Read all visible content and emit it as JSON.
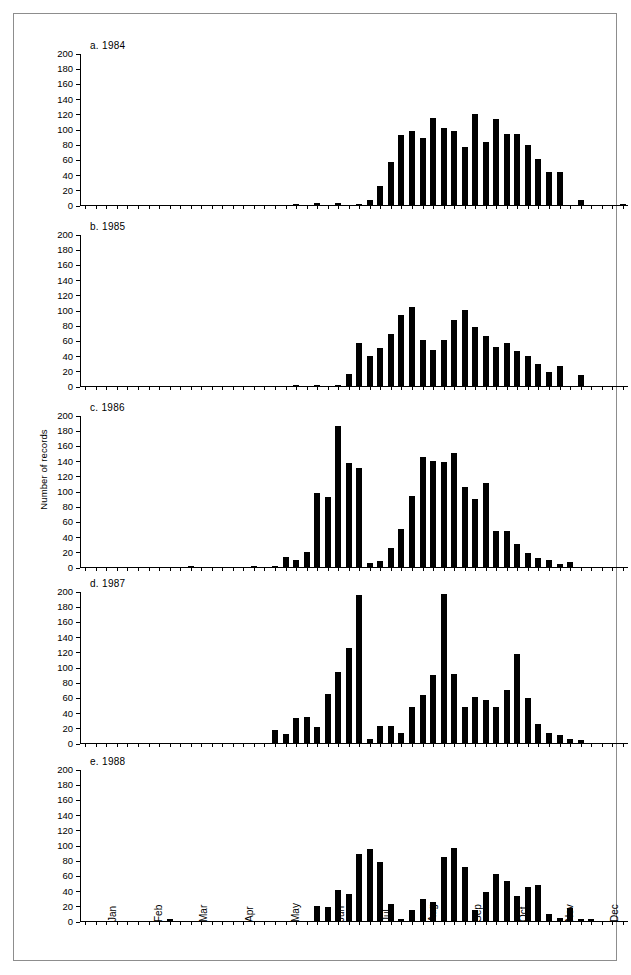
{
  "figure": {
    "ylabel": "Number of records",
    "y_ticks": [
      0,
      20,
      40,
      60,
      80,
      100,
      120,
      140,
      160,
      180,
      200
    ],
    "months": [
      "Jan",
      "Feb",
      "Mar",
      "Apr",
      "May",
      "Jun",
      "Jul",
      "Aug",
      "Sep",
      "Oct",
      "Nov",
      "Dec"
    ]
  },
  "chart_data": [
    {
      "type": "bar",
      "title": "a.  1984",
      "panel": "a",
      "year": 1984,
      "xlabel": "",
      "ylabel": "Number of records",
      "ylim": [
        0,
        200
      ],
      "xlim": [
        1,
        52
      ],
      "grid": false,
      "legend": "none",
      "categories": [
        1,
        2,
        3,
        4,
        5,
        6,
        7,
        8,
        9,
        10,
        11,
        12,
        13,
        14,
        15,
        16,
        17,
        18,
        19,
        20,
        21,
        22,
        23,
        24,
        25,
        26,
        27,
        28,
        29,
        30,
        31,
        32,
        33,
        34,
        35,
        36,
        37,
        38,
        39,
        40,
        41,
        42,
        43,
        44,
        45,
        46,
        47,
        48,
        49,
        50,
        51,
        52
      ],
      "values": [
        0,
        0,
        0,
        0,
        0,
        0,
        0,
        0,
        0,
        0,
        0,
        0,
        0,
        0,
        0,
        0,
        0,
        0,
        0,
        0,
        1,
        0,
        2,
        0,
        2,
        0,
        1,
        7,
        25,
        56,
        92,
        98,
        88,
        115,
        101,
        97,
        76,
        120,
        83,
        113,
        94,
        94,
        79,
        60,
        43,
        43,
        0,
        7,
        0,
        0,
        0,
        1
      ]
    },
    {
      "type": "bar",
      "title": "b.  1985",
      "panel": "b",
      "year": 1985,
      "xlabel": "",
      "ylabel": "Number of records",
      "ylim": [
        0,
        200
      ],
      "xlim": [
        1,
        52
      ],
      "grid": false,
      "legend": "none",
      "categories": [
        1,
        2,
        3,
        4,
        5,
        6,
        7,
        8,
        9,
        10,
        11,
        12,
        13,
        14,
        15,
        16,
        17,
        18,
        19,
        20,
        21,
        22,
        23,
        24,
        25,
        26,
        27,
        28,
        29,
        30,
        31,
        32,
        33,
        34,
        35,
        36,
        37,
        38,
        39,
        40,
        41,
        42,
        43,
        44,
        45,
        46,
        47,
        48,
        49,
        50,
        51,
        52
      ],
      "values": [
        0,
        0,
        0,
        0,
        0,
        0,
        0,
        0,
        0,
        0,
        0,
        0,
        0,
        0,
        0,
        0,
        0,
        0,
        0,
        0,
        1,
        0,
        1,
        0,
        1,
        16,
        57,
        40,
        50,
        68,
        93,
        104,
        61,
        48,
        61,
        87,
        100,
        78,
        66,
        51,
        56,
        46,
        39,
        29,
        18,
        26,
        0,
        14,
        0,
        0,
        0,
        0
      ]
    },
    {
      "type": "bar",
      "title": "c.  1986",
      "panel": "c",
      "year": 1986,
      "xlabel": "",
      "ylabel": "Number of records",
      "ylim": [
        0,
        200
      ],
      "xlim": [
        1,
        52
      ],
      "grid": false,
      "legend": "none",
      "categories": [
        1,
        2,
        3,
        4,
        5,
        6,
        7,
        8,
        9,
        10,
        11,
        12,
        13,
        14,
        15,
        16,
        17,
        18,
        19,
        20,
        21,
        22,
        23,
        24,
        25,
        26,
        27,
        28,
        29,
        30,
        31,
        32,
        33,
        34,
        35,
        36,
        37,
        38,
        39,
        40,
        41,
        42,
        43,
        44,
        45,
        46,
        47,
        48,
        49,
        50,
        51,
        52
      ],
      "values": [
        0,
        0,
        0,
        0,
        0,
        0,
        0,
        0,
        0,
        0,
        1,
        0,
        0,
        0,
        0,
        0,
        1,
        0,
        1,
        13,
        9,
        20,
        97,
        92,
        185,
        137,
        130,
        5,
        8,
        25,
        50,
        94,
        145,
        140,
        138,
        150,
        105,
        90,
        110,
        48,
        48,
        30,
        18,
        12,
        9,
        4,
        6,
        0,
        0,
        0,
        0,
        0
      ]
    },
    {
      "type": "bar",
      "title": "d.  1987",
      "panel": "d",
      "year": 1987,
      "xlabel": "",
      "ylabel": "Number of records",
      "ylim": [
        0,
        200
      ],
      "xlim": [
        1,
        52
      ],
      "grid": false,
      "legend": "none",
      "categories": [
        1,
        2,
        3,
        4,
        5,
        6,
        7,
        8,
        9,
        10,
        11,
        12,
        13,
        14,
        15,
        16,
        17,
        18,
        19,
        20,
        21,
        22,
        23,
        24,
        25,
        26,
        27,
        28,
        29,
        30,
        31,
        32,
        33,
        34,
        35,
        36,
        37,
        38,
        39,
        40,
        41,
        42,
        43,
        44,
        45,
        46,
        47,
        48,
        49,
        50,
        51,
        52
      ],
      "values": [
        0,
        0,
        0,
        0,
        0,
        0,
        0,
        0,
        0,
        0,
        0,
        0,
        0,
        0,
        0,
        0,
        0,
        0,
        17,
        12,
        33,
        34,
        21,
        64,
        93,
        125,
        195,
        5,
        22,
        22,
        13,
        48,
        63,
        90,
        196,
        91,
        48,
        60,
        57,
        48,
        70,
        117,
        59,
        25,
        13,
        11,
        5,
        4,
        0,
        0,
        0,
        0
      ]
    },
    {
      "type": "bar",
      "title": "e.  1988",
      "panel": "e",
      "year": 1988,
      "xlabel": "",
      "ylabel": "Number of records",
      "ylim": [
        0,
        200
      ],
      "xlim": [
        1,
        52
      ],
      "grid": false,
      "legend": "none",
      "categories": [
        1,
        2,
        3,
        4,
        5,
        6,
        7,
        8,
        9,
        10,
        11,
        12,
        13,
        14,
        15,
        16,
        17,
        18,
        19,
        20,
        21,
        22,
        23,
        24,
        25,
        26,
        27,
        28,
        29,
        30,
        31,
        32,
        33,
        34,
        35,
        36,
        37,
        38,
        39,
        40,
        41,
        42,
        43,
        44,
        45,
        46,
        47,
        48,
        49,
        50,
        51,
        52
      ],
      "values": [
        0,
        0,
        0,
        0,
        0,
        0,
        0,
        0,
        2,
        0,
        0,
        0,
        0,
        0,
        0,
        0,
        0,
        0,
        0,
        0,
        0,
        0,
        20,
        19,
        41,
        36,
        88,
        95,
        78,
        23,
        2,
        14,
        29,
        25,
        84,
        96,
        71,
        15,
        38,
        62,
        53,
        33,
        45,
        48,
        9,
        4,
        17,
        2,
        3,
        0,
        0,
        0
      ]
    }
  ]
}
